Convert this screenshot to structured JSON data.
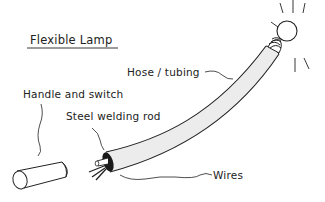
{
  "diagram": {
    "title": "Flexible Lamp",
    "labels": {
      "hose": "Hose / tubing",
      "handle": "Handle and switch",
      "rod": "Steel welding rod",
      "wires": "Wires"
    },
    "components": [
      "handle-cylinder",
      "hose-tube",
      "steel-rod",
      "wires",
      "bulb-socket",
      "light-bulb",
      "light-rays"
    ],
    "colors": {
      "line": "#222222",
      "tube_fill": "#ececec",
      "background": "#ffffff"
    }
  }
}
